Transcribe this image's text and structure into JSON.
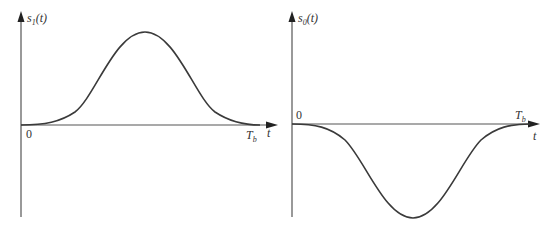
{
  "left_plot": {
    "y_label_main": "s",
    "y_label_sub": "1",
    "y_label_tail": "(t)",
    "origin_label": "0",
    "end_label_main": "T",
    "end_label_sub": "b",
    "x_label": "t",
    "shape": "positive raised-cosine pulse from 0 to T_b"
  },
  "right_plot": {
    "y_label_main": "s",
    "y_label_sub": "0",
    "y_label_tail": "(t)",
    "origin_label": "0",
    "end_label_main": "T",
    "end_label_sub": "b",
    "x_label": "t",
    "shape": "negative raised-cosine pulse from 0 to T_b"
  },
  "colors": {
    "axis": "#555555",
    "curve": "#3a3a3a",
    "background": "#ffffff"
  }
}
